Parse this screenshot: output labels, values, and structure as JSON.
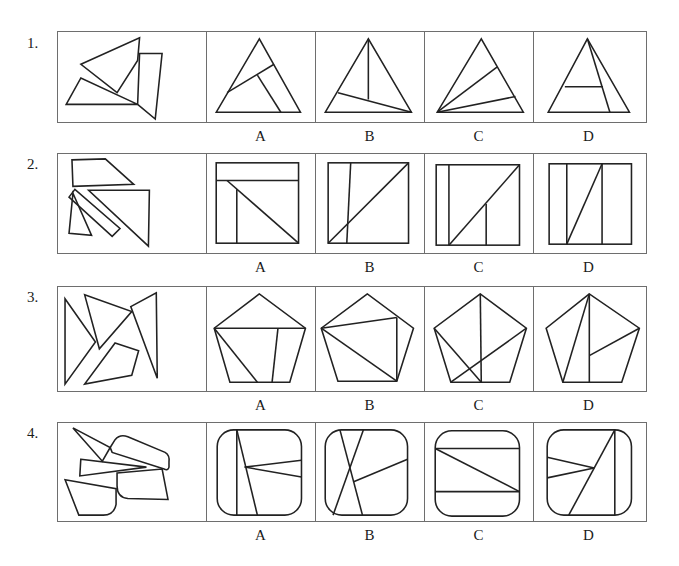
{
  "questions": [
    {
      "number": "1.",
      "given_label": "scattered pieces: 3 polygons",
      "target_shape": "triangle",
      "options": [
        {
          "label": "A"
        },
        {
          "label": "B"
        },
        {
          "label": "C"
        },
        {
          "label": "D"
        }
      ]
    },
    {
      "number": "2.",
      "given_label": "scattered pieces: 4 polygons",
      "target_shape": "square",
      "options": [
        {
          "label": "A"
        },
        {
          "label": "B"
        },
        {
          "label": "C"
        },
        {
          "label": "D"
        }
      ]
    },
    {
      "number": "3.",
      "given_label": "scattered pieces: 4 polygons",
      "target_shape": "pentagon",
      "options": [
        {
          "label": "A"
        },
        {
          "label": "B"
        },
        {
          "label": "C"
        },
        {
          "label": "D"
        }
      ]
    },
    {
      "number": "4.",
      "given_label": "scattered pieces: 5 polygons",
      "target_shape": "rounded square",
      "options": [
        {
          "label": "A"
        },
        {
          "label": "B"
        },
        {
          "label": "C"
        },
        {
          "label": "D"
        }
      ]
    }
  ],
  "colors": {
    "stroke": "#222222",
    "border": "#6e6e6e",
    "background": "#ffffff"
  }
}
